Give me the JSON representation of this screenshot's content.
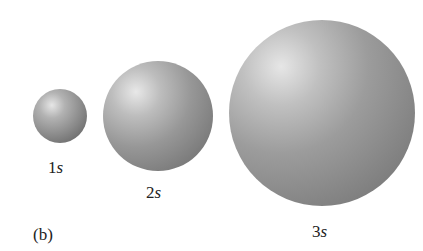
{
  "figure": {
    "panel_label": "(b)",
    "orbitals": [
      {
        "number": "1",
        "letter": "s"
      },
      {
        "number": "2",
        "letter": "s"
      },
      {
        "number": "3",
        "letter": "s"
      }
    ],
    "colors": {
      "background": "#ffffff",
      "sphere_highlight": "#e6e6e6",
      "sphere_shadow": "#6e6e6e"
    }
  }
}
